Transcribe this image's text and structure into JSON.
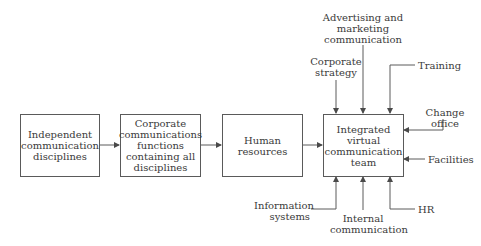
{
  "diagram": {
    "flow_boxes": [
      {
        "id": "independent",
        "label": "Independent\ncommunication\ndisciplines"
      },
      {
        "id": "corporate",
        "label": "Corporate\ncommunications\nfunctions\ncontaining all\ndisciplines"
      },
      {
        "id": "hr",
        "label": "Human\nresources"
      },
      {
        "id": "ivct",
        "label": "Integrated\nvirtual\ncommunication\nteam"
      }
    ],
    "inputs": {
      "corporate_strategy": "Corporate\nstrategy",
      "advertising": "Advertising and\nmarketing\ncommunication",
      "training": "Training",
      "change_office": "Change\noffice",
      "facilities": "Facilities",
      "information_systems": "Information\nsystems",
      "internal_communication": "Internal\ncommunication",
      "hr_input": "HR"
    },
    "colors": {
      "line": "#5a5a5a",
      "text": "#3a3a3a",
      "background": "#ffffff"
    }
  }
}
